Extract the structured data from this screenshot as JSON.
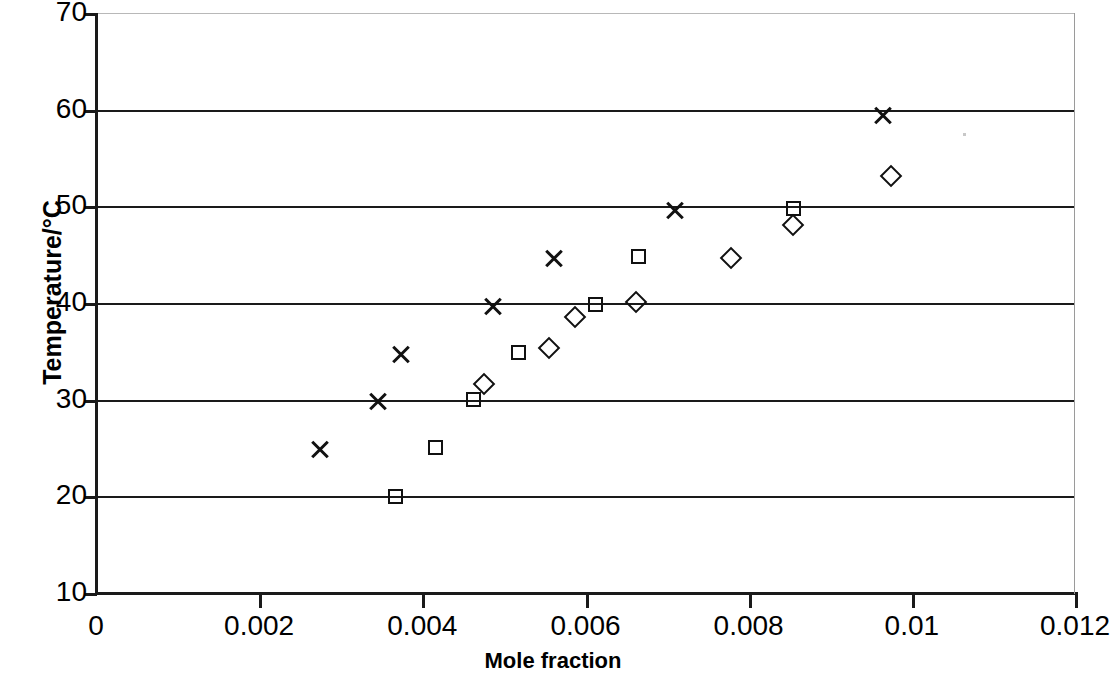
{
  "chart_data": {
    "type": "scatter",
    "title": "",
    "xlabel": "Mole fraction",
    "ylabel": "Temperature/°C",
    "xlim": [
      0,
      0.012
    ],
    "ylim": [
      10,
      70
    ],
    "xticks": [
      "0",
      "0.002",
      "0.004",
      "0.006",
      "0.008",
      "0.01",
      "0.012"
    ],
    "xtick_values": [
      0,
      0.002,
      0.004,
      0.006,
      0.008,
      0.01,
      0.012
    ],
    "yticks": [
      "10",
      "20",
      "30",
      "40",
      "50",
      "60",
      "70"
    ],
    "ytick_values": [
      10,
      20,
      30,
      40,
      50,
      60,
      70
    ],
    "grid": "horizontal",
    "legend": "none",
    "series": [
      {
        "name": "cross-series",
        "marker": "cross",
        "color": "#111111",
        "points": [
          {
            "x": 0.00274,
            "y": 24.8
          },
          {
            "x": 0.00346,
            "y": 29.8
          },
          {
            "x": 0.00374,
            "y": 34.7
          },
          {
            "x": 0.00487,
            "y": 39.6
          },
          {
            "x": 0.00561,
            "y": 44.6
          },
          {
            "x": 0.0071,
            "y": 49.6
          },
          {
            "x": 0.00965,
            "y": 59.4
          }
        ]
      },
      {
        "name": "square-series",
        "marker": "square",
        "color": "#111111",
        "points": [
          {
            "x": 0.00368,
            "y": 19.9
          },
          {
            "x": 0.00417,
            "y": 25.0
          },
          {
            "x": 0.00463,
            "y": 30.0
          },
          {
            "x": 0.00519,
            "y": 34.8
          },
          {
            "x": 0.00613,
            "y": 39.8
          },
          {
            "x": 0.00666,
            "y": 44.8
          },
          {
            "x": 0.00855,
            "y": 49.7
          }
        ]
      },
      {
        "name": "diamond-series",
        "marker": "diamond",
        "color": "#111111",
        "points": [
          {
            "x": 0.00477,
            "y": 31.5
          },
          {
            "x": 0.00556,
            "y": 35.2
          },
          {
            "x": 0.00588,
            "y": 38.4
          },
          {
            "x": 0.00663,
            "y": 40.0
          },
          {
            "x": 0.0078,
            "y": 44.6
          },
          {
            "x": 0.00856,
            "y": 48.0
          },
          {
            "x": 0.00976,
            "y": 53.0
          }
        ]
      }
    ]
  }
}
